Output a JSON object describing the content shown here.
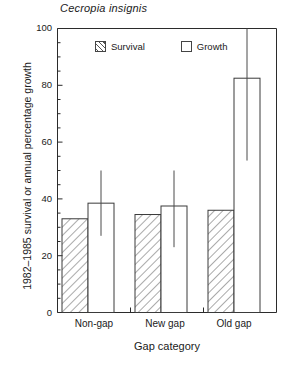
{
  "chart_data": {
    "type": "bar",
    "title": "Cecropia insignis",
    "xlabel": "Gap category",
    "ylabel": "1982–1985 survival or annual percentage growth",
    "categories": [
      "Non-gap",
      "New gap",
      "Old gap"
    ],
    "ylim": [
      0,
      100
    ],
    "yticks": [
      0,
      20,
      40,
      60,
      80,
      100
    ],
    "ytick_labels": [
      "0",
      "20",
      "40",
      "60",
      "80",
      "100"
    ],
    "y_minor_tick_step": 5,
    "grid": false,
    "legend_position": "upper-center",
    "series": [
      {
        "name": "Survival",
        "fill": "hatched-45",
        "values": [
          33.0,
          34.5,
          36.0
        ],
        "errors_low": [
          null,
          null,
          null
        ],
        "errors_high": [
          null,
          null,
          null
        ]
      },
      {
        "name": "Growth",
        "fill": "open",
        "values": [
          38.5,
          37.5,
          82.5
        ],
        "errors_low": [
          27.0,
          23.0,
          53.5
        ],
        "errors_high": [
          50.0,
          50.0,
          100.0
        ],
        "error_note": "Old gap upper error bar extends beyond the plotted axis maximum"
      }
    ]
  },
  "legend": {
    "items": [
      {
        "label": "Survival",
        "swatch": "hatched-square-icon"
      },
      {
        "label": "Growth",
        "swatch": "open-square-icon"
      }
    ]
  },
  "axes": {
    "y_label": "1982–1985 survival or annual percentage growth",
    "x_label": "Gap category",
    "y_tick_labels": [
      "100",
      "80",
      "60",
      "40",
      "20",
      "0"
    ],
    "x_tick_labels": [
      "Non-gap",
      "New gap",
      "Old gap"
    ]
  },
  "title": "Cecropia insignis",
  "colors": {
    "axis": "#2b2b2b",
    "bar_outline": "#3a3a3a",
    "hatch": "#555555",
    "background": "#ffffff",
    "error_bar": "#4a4a4a"
  }
}
